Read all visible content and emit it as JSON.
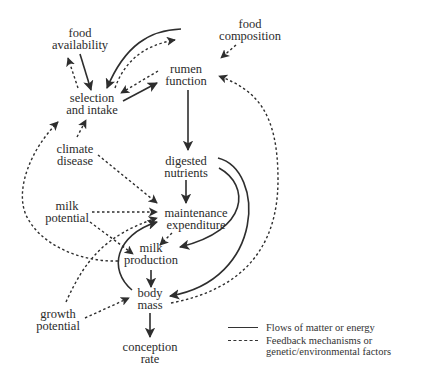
{
  "diagram": {
    "title": "",
    "colors": {
      "stroke": "#2e2e2e",
      "text": "#2b2b2b",
      "background": "#ffffff"
    },
    "nodes": [
      {
        "id": "food_availability",
        "lines": [
          "food",
          "availability"
        ],
        "x": 80,
        "y": 39
      },
      {
        "id": "food_composition",
        "lines": [
          "food",
          "composition"
        ],
        "x": 250,
        "y": 30
      },
      {
        "id": "rumen_function",
        "lines": [
          "rumen",
          "function"
        ],
        "x": 186,
        "y": 75
      },
      {
        "id": "selection_intake",
        "lines": [
          "selection",
          "and intake"
        ],
        "x": 92,
        "y": 104
      },
      {
        "id": "climate_disease",
        "lines": [
          "climate",
          "disease"
        ],
        "x": 75,
        "y": 155
      },
      {
        "id": "digested_nutrients",
        "lines": [
          "digested",
          "nutrients"
        ],
        "x": 186,
        "y": 167
      },
      {
        "id": "milk_potential",
        "lines": [
          "milk",
          "potential"
        ],
        "x": 67,
        "y": 212
      },
      {
        "id": "maintenance_expenditure",
        "lines": [
          "maintenance",
          "expenditure"
        ],
        "x": 196,
        "y": 219
      },
      {
        "id": "milk_production",
        "lines": [
          "milk",
          "production"
        ],
        "x": 151,
        "y": 254
      },
      {
        "id": "body_mass",
        "lines": [
          "body",
          "mass"
        ],
        "x": 150,
        "y": 299
      },
      {
        "id": "growth_potential",
        "lines": [
          "growth",
          "potential"
        ],
        "x": 58,
        "y": 320
      },
      {
        "id": "conception_rate",
        "lines": [
          "conception",
          "rate"
        ],
        "x": 150,
        "y": 353
      }
    ],
    "edges": [
      {
        "from": "food_availability",
        "to": "selection_intake",
        "style": "solid",
        "path": "M80 54 L91 90"
      },
      {
        "from": "selection_intake",
        "to": "food_availability",
        "style": "dashed",
        "path": "M78 88 L68 58"
      },
      {
        "from": "food_composition",
        "to": "selection_intake",
        "style": "solid",
        "path": "M181 29 C150 30 125 45 107 88"
      },
      {
        "from": "selection_intake",
        "to": "food_composition",
        "style": "dashed",
        "path": "M115 88 C125 60 145 45 175 40"
      },
      {
        "from": "food_composition",
        "to": "rumen_function",
        "style": "dashed",
        "path": "M236 45 L221 58"
      },
      {
        "from": "rumen_function",
        "to": "selection_intake",
        "style": "dashed",
        "path": "M158 71 L121 93"
      },
      {
        "from": "selection_intake",
        "to": "rumen_function",
        "style": "solid",
        "path": "M123 101 L157 83"
      },
      {
        "from": "rumen_function",
        "to": "digested_nutrients",
        "style": "solid",
        "path": "M188 90 L188 150"
      },
      {
        "from": "climate_disease",
        "to": "selection_intake",
        "style": "dashed",
        "path": "M77 137 L86 120"
      },
      {
        "from": "climate_disease",
        "to": "maintenance_expenditure",
        "style": "dashed",
        "path": "M98 155 L157 203"
      },
      {
        "from": "digested_nutrients",
        "to": "maintenance_expenditure",
        "style": "solid",
        "path": "M186 180 L186 203"
      },
      {
        "from": "digested_nutrients",
        "to": "milk_production",
        "style": "solid",
        "path": "M219 168 C250 185 250 230 180 247"
      },
      {
        "from": "digested_nutrients",
        "to": "body_mass",
        "style": "solid",
        "path": "M218 158 C265 170 265 280 170 296"
      },
      {
        "from": "milk_potential",
        "to": "maintenance_expenditure",
        "style": "dashed",
        "path": "M92 212 L157 212"
      },
      {
        "from": "milk_potential",
        "to": "milk_production",
        "style": "dashed",
        "path": "M90 222 L133 254"
      },
      {
        "from": "maintenance_expenditure",
        "to": "milk_production",
        "style": "dashed",
        "path": "M172 233 L160 245"
      },
      {
        "from": "milk_production",
        "to": "body_mass",
        "style": "solid",
        "path": "M151 270 L151 287"
      },
      {
        "from": "body_mass",
        "to": "maintenance_expenditure",
        "style": "solid",
        "path": "M132 290 C108 270 115 235 157 222"
      },
      {
        "from": "milk_production",
        "to": "selection_intake",
        "style": "dashed",
        "path": "M118 261 C80 262 40 245 26 215 C15 190 30 150 58 122"
      },
      {
        "from": "growth_potential",
        "to": "maintenance_expenditure",
        "style": "dashed",
        "path": "M66 302 C85 260 105 235 157 218"
      },
      {
        "from": "growth_potential",
        "to": "body_mass",
        "style": "dashed",
        "path": "M85 318 L129 298"
      },
      {
        "from": "body_mass",
        "to": "rumen_function",
        "style": "dashed",
        "path": "M171 303 C240 290 278 250 278 180 C278 110 255 90 219 76"
      },
      {
        "from": "body_mass",
        "to": "conception_rate",
        "style": "solid",
        "path": "M150 313 L150 337"
      }
    ],
    "legend": [
      {
        "style": "solid",
        "label": "Flows of matter or energy"
      },
      {
        "style": "dashed",
        "label": "Feedback mechanisms or",
        "label2": "genetic/environmental factors"
      }
    ]
  }
}
